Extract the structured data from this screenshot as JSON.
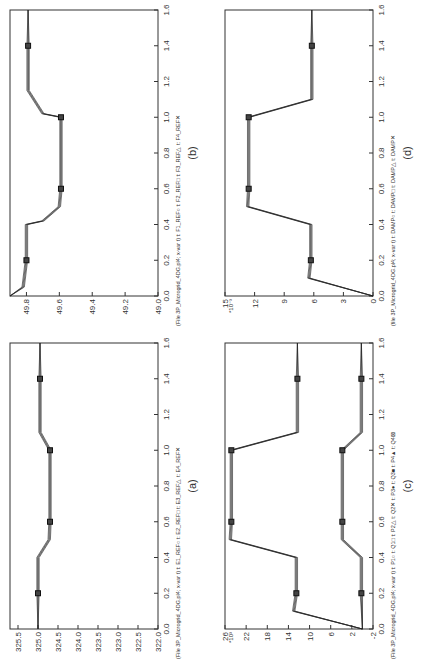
{
  "figure": {
    "panels": [
      {
        "id": "b",
        "caption": "(b)",
        "pos": "top-left",
        "legend": "(File 3P_Microgrid_4DG.pl4; x-var t) t: F1_REF○  t: F2_REF□  t: F3_REF△  t: F4_REF✕",
        "yticks": [
          "49.0",
          "49.2",
          "49.4",
          "49.6",
          "49.8"
        ],
        "ylim": [
          49.0,
          49.9
        ],
        "yexp": ""
      },
      {
        "id": "d",
        "caption": "(d)",
        "pos": "top-right",
        "legend": "(file 3P_Microgrid_4DG.pl4; x-var t) t: DAMP○  t: DAMP□  t: DAMP△  t: DAMP✕",
        "yticks": [
          "0",
          "3",
          "6",
          "9",
          "12",
          "15"
        ],
        "ylim": [
          0,
          15
        ],
        "yexp": "*10⁻³"
      },
      {
        "id": "a",
        "caption": "(a)",
        "pos": "bottom-left",
        "legend": "(File 3P_Microgrid_4DG.pl4; x-var t) t: E1_REF○  t: E2_REF□  t: E3_REF△  t: E4_REF✕",
        "yticks": [
          "322.0",
          "322.5",
          "323.0",
          "323.5",
          "324.0",
          "324.5",
          "325.0",
          "325.5"
        ],
        "ylim": [
          322.0,
          325.7
        ],
        "yexp": ""
      },
      {
        "id": "c",
        "caption": "(c)",
        "pos": "bottom-right",
        "legend": "(File 3P_Microgrid_4DG.pl4; x-var t) t: P1○  t: Q1□  t: P2△  t: Q2✕  t: P3●  t: Q3■  t: P4▲  t: Q4⊠",
        "yticks": [
          "-2",
          "2",
          "6",
          "10",
          "14",
          "18",
          "22",
          "26"
        ],
        "ylim": [
          -2,
          26
        ],
        "yexp": "*10³"
      }
    ],
    "xticks": [
      "0.0",
      "0.2",
      "0.4",
      "0.6",
      "0.8",
      "1.0",
      "1.2",
      "1.4",
      "1.6"
    ],
    "xlim": [
      0,
      1.6
    ]
  },
  "chart_data": [
    {
      "type": "line",
      "title": "(b)",
      "xlabel": "t",
      "ylabel": "F_REF",
      "xlim": [
        0,
        1.6
      ],
      "ylim": [
        49.0,
        49.9
      ],
      "series": [
        {
          "name": "F1_REF"
        },
        {
          "name": "F2_REF"
        },
        {
          "name": "F3_REF"
        },
        {
          "name": "F4_REF"
        }
      ],
      "x": [
        0.0,
        0.05,
        0.2,
        0.4,
        0.42,
        0.5,
        0.6,
        1.0,
        1.02,
        1.15,
        1.4,
        1.6
      ],
      "values": [
        49.9,
        49.82,
        49.8,
        49.8,
        49.7,
        49.6,
        49.59,
        49.59,
        49.7,
        49.79,
        49.79,
        49.79
      ]
    },
    {
      "type": "line",
      "title": "(d)",
      "xlabel": "t",
      "ylabel": "DAMP (*10^-3)",
      "xlim": [
        0,
        1.6
      ],
      "ylim": [
        0,
        15
      ],
      "series": [
        {
          "name": "DAMP1"
        },
        {
          "name": "DAMP2"
        },
        {
          "name": "DAMP3"
        },
        {
          "name": "DAMP4"
        }
      ],
      "x": [
        0.0,
        0.1,
        0.2,
        0.4,
        0.5,
        0.6,
        1.0,
        1.1,
        1.4,
        1.6
      ],
      "values": [
        0,
        6.5,
        6.3,
        6.3,
        12.7,
        12.6,
        12.6,
        6.2,
        6.2,
        6.2
      ]
    },
    {
      "type": "line",
      "title": "(a)",
      "xlabel": "t",
      "ylabel": "E_REF",
      "xlim": [
        0,
        1.6
      ],
      "ylim": [
        322.0,
        325.7
      ],
      "series": [
        {
          "name": "E1_REF"
        },
        {
          "name": "E2_REF"
        },
        {
          "name": "E3_REF"
        },
        {
          "name": "E4_REF"
        }
      ],
      "x": [
        0.0,
        0.2,
        0.4,
        0.5,
        0.6,
        1.0,
        1.1,
        1.4,
        1.6
      ],
      "values": [
        325.0,
        325.0,
        325.0,
        324.72,
        324.7,
        324.7,
        324.95,
        324.95,
        324.95
      ]
    },
    {
      "type": "line",
      "title": "(c)",
      "xlabel": "t",
      "ylabel": "P/Q (*10^3)",
      "xlim": [
        0,
        1.6
      ],
      "ylim": [
        -2,
        26
      ],
      "series": [
        {
          "name": "P (P1-P4)",
          "x": [
            0.0,
            0.1,
            0.2,
            0.4,
            0.5,
            0.6,
            1.0,
            1.1,
            1.4,
            1.6
          ],
          "values": [
            0,
            13,
            12.5,
            12.5,
            25,
            24.8,
            24.8,
            12.3,
            12.3,
            12.3
          ]
        },
        {
          "name": "Q (Q1-Q4)",
          "x": [
            0.0,
            0.2,
            0.4,
            0.5,
            0.6,
            1.0,
            1.1,
            1.4,
            1.6
          ],
          "values": [
            0,
            0.2,
            0.2,
            3.8,
            3.8,
            3.8,
            0.2,
            0.2,
            0.2
          ]
        }
      ]
    }
  ]
}
